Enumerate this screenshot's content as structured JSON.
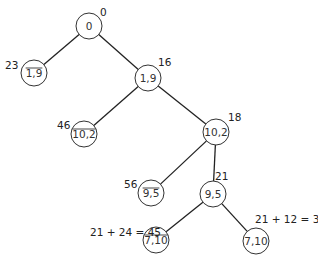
{
  "diagram": {
    "type": "branch-and-bound-tree",
    "nodes": [
      {
        "id": "root",
        "label": "0",
        "negated": false,
        "cost": "0",
        "cx": 89,
        "cy": 26
      },
      {
        "id": "not_1_9",
        "label": "1,9",
        "negated": true,
        "cost": "23",
        "cx": 34,
        "cy": 73
      },
      {
        "id": "1_9",
        "label": "1,9",
        "negated": false,
        "cost": "16",
        "cx": 148,
        "cy": 78
      },
      {
        "id": "not_10_2",
        "label": "10,2",
        "negated": true,
        "cost": "46",
        "cx": 84,
        "cy": 134
      },
      {
        "id": "10_2",
        "label": "10,2",
        "negated": false,
        "cost": "18",
        "cx": 216,
        "cy": 132
      },
      {
        "id": "not_9_5",
        "label": "9,5",
        "negated": true,
        "cost": "56",
        "cx": 151,
        "cy": 193
      },
      {
        "id": "9_5",
        "label": "9,5",
        "negated": false,
        "cost": "21",
        "cx": 213,
        "cy": 194
      },
      {
        "id": "not_7_10",
        "label": "7,10",
        "negated": true,
        "cost": "21 + 24 = 45",
        "cx": 156,
        "cy": 240
      },
      {
        "id": "7_10",
        "label": "7,10",
        "negated": false,
        "cost": "21 + 12 = 33",
        "cx": 256,
        "cy": 241
      }
    ],
    "edges": [
      {
        "from": "root",
        "to": "not_1_9"
      },
      {
        "from": "root",
        "to": "1_9"
      },
      {
        "from": "1_9",
        "to": "not_10_2"
      },
      {
        "from": "1_9",
        "to": "10_2"
      },
      {
        "from": "10_2",
        "to": "not_9_5"
      },
      {
        "from": "10_2",
        "to": "9_5"
      },
      {
        "from": "9_5",
        "to": "not_7_10"
      },
      {
        "from": "9_5",
        "to": "7_10"
      }
    ],
    "labels": {
      "root": {
        "text": "0",
        "x": 100,
        "y": 16
      },
      "not_1_9": {
        "text": "23",
        "x": 5,
        "y": 69
      },
      "1_9": {
        "text": "16",
        "x": 158,
        "y": 66
      },
      "not_10_2": {
        "text": "46",
        "x": 57,
        "y": 129
      },
      "10_2": {
        "text": "18",
        "x": 228,
        "y": 121
      },
      "not_9_5": {
        "text": "56",
        "x": 124,
        "y": 188
      },
      "9_5": {
        "text": "21",
        "x": 215,
        "y": 180
      },
      "not_7_10": {
        "text": "21 + 24 = 45",
        "x": 90,
        "y": 236
      },
      "7_10": {
        "text": "21 + 12 = 33",
        "x": 255,
        "y": 223
      }
    }
  }
}
